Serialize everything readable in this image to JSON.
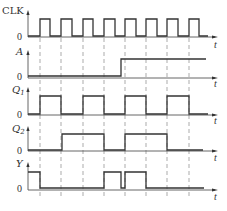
{
  "diagram": {
    "type": "timing-diagram",
    "time_axis_label": "t",
    "zero_label": "0",
    "clock_edges_x": [
      40,
      61,
      83,
      104,
      125,
      146,
      167,
      189
    ],
    "signals": [
      {
        "name": "CLK",
        "italic": false,
        "baseline_y": 36,
        "high_y": 19,
        "arrow_top": 10,
        "points": [
          [
            28,
            36
          ],
          [
            40,
            36
          ],
          [
            40,
            19
          ],
          [
            50,
            19
          ],
          [
            50,
            36
          ],
          [
            61,
            36
          ],
          [
            61,
            19
          ],
          [
            72,
            19
          ],
          [
            72,
            36
          ],
          [
            83,
            36
          ],
          [
            83,
            19
          ],
          [
            93,
            19
          ],
          [
            93,
            36
          ],
          [
            104,
            36
          ],
          [
            104,
            19
          ],
          [
            115,
            19
          ],
          [
            115,
            36
          ],
          [
            125,
            36
          ],
          [
            125,
            19
          ],
          [
            136,
            19
          ],
          [
            136,
            36
          ],
          [
            146,
            36
          ],
          [
            146,
            19
          ],
          [
            157,
            19
          ],
          [
            157,
            36
          ],
          [
            167,
            36
          ],
          [
            167,
            19
          ],
          [
            178,
            19
          ],
          [
            178,
            36
          ],
          [
            189,
            36
          ],
          [
            189,
            19
          ],
          [
            199,
            19
          ],
          [
            199,
            36
          ],
          [
            208,
            36
          ]
        ]
      },
      {
        "name": "A",
        "italic": true,
        "baseline_y": 77,
        "high_y": 59,
        "arrow_top": 50,
        "points": [
          [
            28,
            76
          ],
          [
            121,
            76
          ],
          [
            121,
            59
          ],
          [
            206,
            59
          ]
        ]
      },
      {
        "name": "Q1",
        "italic": true,
        "baseline_y": 114,
        "high_y": 96,
        "arrow_top": 87,
        "points": [
          [
            28,
            114
          ],
          [
            40,
            114
          ],
          [
            40,
            96
          ],
          [
            61,
            96
          ],
          [
            61,
            114
          ],
          [
            83,
            114
          ],
          [
            83,
            96
          ],
          [
            104,
            96
          ],
          [
            104,
            114
          ],
          [
            125,
            114
          ],
          [
            125,
            96
          ],
          [
            146,
            96
          ],
          [
            146,
            114
          ],
          [
            167,
            114
          ],
          [
            167,
            96
          ],
          [
            189,
            96
          ],
          [
            189,
            114
          ],
          [
            208,
            114
          ]
        ]
      },
      {
        "name": "Q2",
        "italic": true,
        "baseline_y": 150,
        "high_y": 134,
        "arrow_top": 126,
        "points": [
          [
            28,
            150
          ],
          [
            62,
            150
          ],
          [
            62,
            134
          ],
          [
            104,
            134
          ],
          [
            104,
            150
          ],
          [
            125,
            150
          ],
          [
            125,
            134
          ],
          [
            167,
            134
          ],
          [
            167,
            150
          ],
          [
            203,
            150
          ]
        ]
      },
      {
        "name": "Y",
        "italic": true,
        "baseline_y": 189,
        "high_y": 172,
        "arrow_top": 162,
        "points": [
          [
            28,
            172
          ],
          [
            40,
            172
          ],
          [
            40,
            188
          ],
          [
            104,
            188
          ],
          [
            104,
            172
          ],
          [
            121,
            172
          ],
          [
            121,
            188
          ],
          [
            125,
            188
          ],
          [
            125,
            172
          ],
          [
            146,
            172
          ],
          [
            146,
            188
          ],
          [
            204,
            188
          ]
        ]
      }
    ],
    "labels": {
      "clk": "CLK",
      "a": "A",
      "q1_main": "Q",
      "q1_sub": "1",
      "q2_main": "Q",
      "q2_sub": "2",
      "y": "Y"
    }
  }
}
